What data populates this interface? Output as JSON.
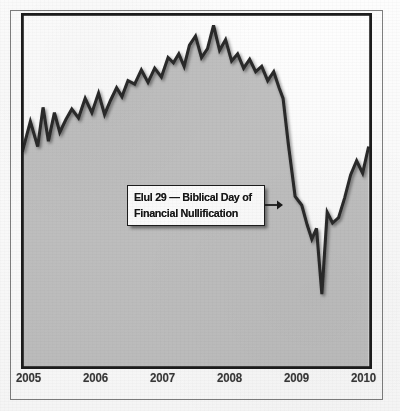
{
  "figure": {
    "background_color": "#fdfdfd",
    "paper_style": "scanned-photocopy",
    "top_caption": "",
    "outer_frame_color": "#7e7e7e",
    "plot_border_color": "#1d1d1d"
  },
  "annotation": {
    "line1": "Elul 29 — Biblical Day of",
    "line2": "Financial Nullification",
    "arrow_direction": "right",
    "box_fill": "#fefefe",
    "box_border": "#1d1d1d"
  },
  "chart_data": {
    "type": "area",
    "title": "",
    "subtitle": "",
    "xlabel": "",
    "ylabel": "",
    "grid": false,
    "legend_position": "none",
    "xlim": [
      2004.8,
      2010.05
    ],
    "ylim": [
      0,
      100
    ],
    "tick_labels": [
      "2005",
      "2006",
      "2007",
      "2008",
      "2009",
      "2010"
    ],
    "tick_x_positions": [
      2005.0,
      2006.0,
      2007.0,
      2008.0,
      2009.0,
      2010.0
    ],
    "line_color": "#2b2b2b",
    "fill_color": "#c1c1c1",
    "marker_line": {
      "label": "Elul 29",
      "x": 2008.72,
      "color": "#1d1d1d"
    },
    "series": [
      {
        "name": "Stock Market Index",
        "x": [
          2004.82,
          2004.94,
          2005.05,
          2005.13,
          2005.21,
          2005.3,
          2005.38,
          2005.47,
          2005.56,
          2005.66,
          2005.76,
          2005.86,
          2005.96,
          2006.05,
          2006.14,
          2006.23,
          2006.31,
          2006.4,
          2006.5,
          2006.6,
          2006.7,
          2006.8,
          2006.9,
          2007.0,
          2007.08,
          2007.16,
          2007.24,
          2007.32,
          2007.41,
          2007.5,
          2007.59,
          2007.68,
          2007.77,
          2007.86,
          2007.95,
          2008.04,
          2008.13,
          2008.22,
          2008.31,
          2008.4,
          2008.49,
          2008.58,
          2008.66,
          2008.72,
          2008.8,
          2008.9,
          2009.0,
          2009.08,
          2009.15,
          2009.22,
          2009.3,
          2009.38,
          2009.46,
          2009.55,
          2009.64,
          2009.73,
          2009.82,
          2009.91,
          2010.0
        ],
        "values": [
          61.0,
          69.5,
          62.5,
          73.5,
          64.0,
          72.0,
          66.5,
          70.0,
          73.0,
          70.5,
          76.0,
          72.0,
          77.5,
          71.5,
          75.5,
          79.0,
          76.5,
          81.0,
          80.0,
          84.0,
          80.5,
          84.5,
          82.0,
          87.5,
          86.0,
          88.5,
          85.0,
          91.0,
          93.5,
          87.5,
          90.0,
          96.5,
          89.5,
          92.5,
          86.5,
          88.5,
          84.5,
          87.0,
          83.5,
          85.0,
          81.0,
          83.5,
          79.0,
          76.0,
          63.0,
          48.5,
          46.0,
          40.5,
          36.5,
          39.5,
          21.0,
          44.0,
          41.0,
          42.5,
          48.0,
          54.5,
          58.5,
          55.0,
          62.5
        ]
      }
    ]
  }
}
